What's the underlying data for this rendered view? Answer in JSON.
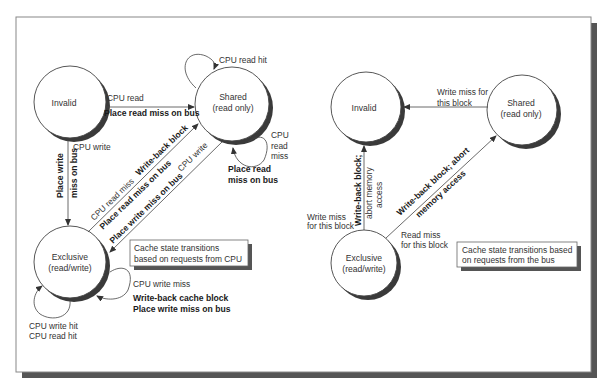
{
  "figure": {
    "frame": {
      "border_color": "#888888",
      "shadow_color": "#555555"
    },
    "left_diagram": {
      "states": {
        "invalid": {
          "label": "Invalid"
        },
        "shared": {
          "label_line1": "Shared",
          "label_line2": "(read only)"
        },
        "exclusive": {
          "label_line1": "Exclusive",
          "label_line2": "(read/write)"
        }
      },
      "transitions": {
        "invalid_to_shared": {
          "event": "CPU read",
          "action": "Place read miss on bus"
        },
        "invalid_to_exclusive": {
          "event": "CPU write",
          "action_line1": "Place write",
          "action_line2": "miss on bus"
        },
        "shared_self_hit": {
          "event": "CPU read hit"
        },
        "shared_self_miss": {
          "event_line1": "CPU",
          "event_line2": "read",
          "event_line3": "miss",
          "action_line1": "Place read",
          "action_line2": "miss on bus"
        },
        "exclusive_to_shared": {
          "event": "CPU read miss",
          "action1": "Write-back block",
          "action2": "Place read miss on bus"
        },
        "shared_to_exclusive": {
          "event": "CPU write",
          "action": "Place write miss on bus"
        },
        "exclusive_self_miss": {
          "event": "CPU write miss",
          "action_line1": "Write-back cache block",
          "action_line2": "Place write miss on bus"
        },
        "exclusive_self_hit": {
          "event_line1": "CPU write hit",
          "event_line2": "CPU read hit"
        }
      },
      "caption": {
        "line1": "Cache state transitions",
        "line2": "based on requests from CPU"
      }
    },
    "right_diagram": {
      "states": {
        "invalid": {
          "label": "Invalid"
        },
        "shared": {
          "label_line1": "Shared",
          "label_line2": "(read only)"
        },
        "exclusive": {
          "label_line1": "Exclusive",
          "label_line2": "(read/write)"
        }
      },
      "transitions": {
        "shared_to_invalid": {
          "event_line1": "Write miss for",
          "event_line2": "this block"
        },
        "exclusive_to_invalid": {
          "event_line1": "Write miss",
          "event_line2": "for this block",
          "action_line1": "Write-back block;",
          "action_line2": "abort memory",
          "action_line3": "access"
        },
        "exclusive_to_shared": {
          "event_line1": "Read miss",
          "event_line2": "for this block",
          "action_line1": "Write-back block; abort",
          "action_line2": "memory access"
        }
      },
      "caption": {
        "line1": "Cache state transitions based",
        "line2": "on requests from the bus"
      }
    }
  }
}
